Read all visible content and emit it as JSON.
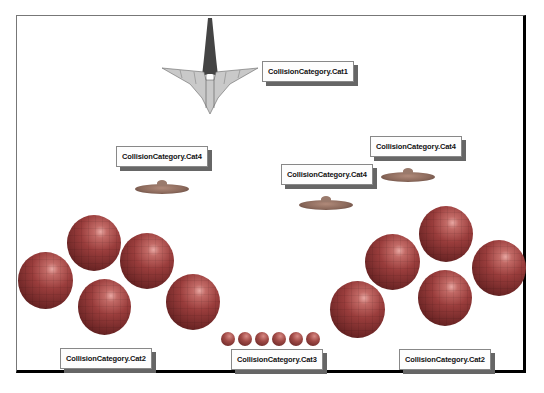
{
  "scene": {
    "labels": {
      "cat1": "CollisionCategory.Cat1",
      "cat4_left": "CollisionCategory.Cat4",
      "cat4_middle": "CollisionCategory.Cat4",
      "cat4_right": "CollisionCategory.Cat4",
      "cat2_left": "CollisionCategory.Cat2",
      "cat3": "CollisionCategory.Cat3",
      "cat2_right": "CollisionCategory.Cat2"
    },
    "objects": {
      "ship": "spaceship",
      "discs": 3,
      "large_spheres_left": 5,
      "large_spheres_right": 5,
      "small_spheres": 6
    }
  }
}
